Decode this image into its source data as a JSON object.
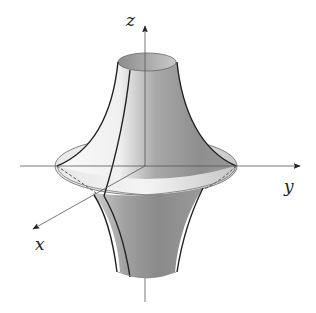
{
  "figure": {
    "axes": {
      "x": {
        "label": "x"
      },
      "y": {
        "label": "y"
      },
      "z": {
        "label": "z"
      }
    },
    "colors": {
      "background": "#ffffff",
      "axis": "#555555",
      "surface_light": "#f2f2f2",
      "surface_dark": "#8a8a8a",
      "outline": "#222222"
    }
  }
}
